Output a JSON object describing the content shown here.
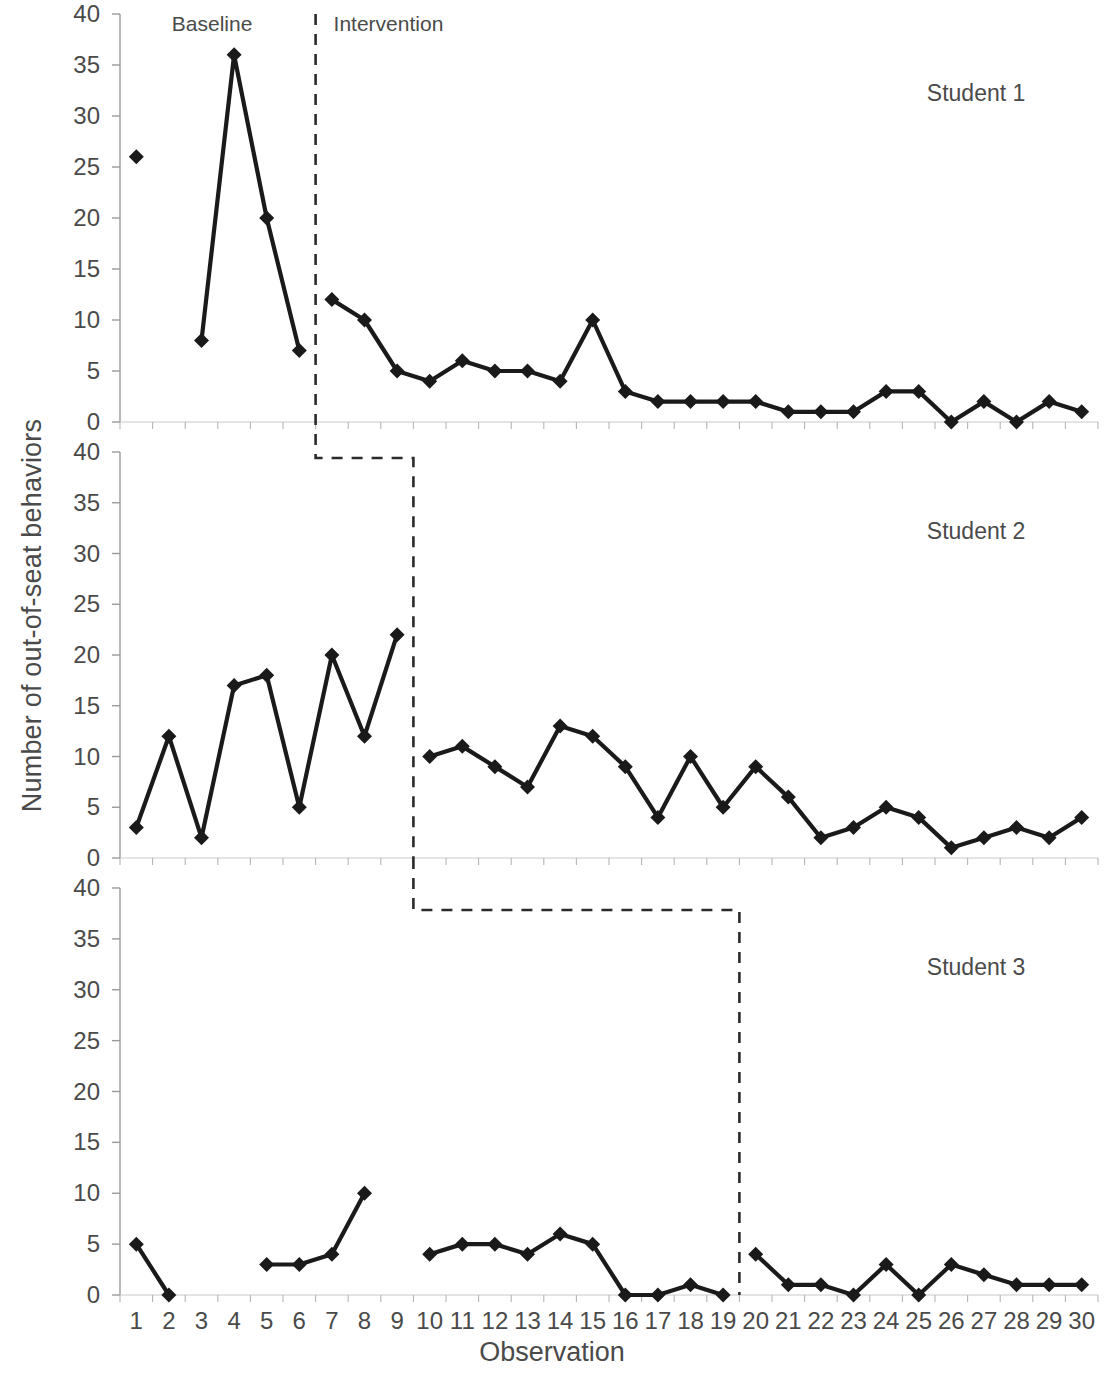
{
  "axes": {
    "ylabel": "Number of out-of-seat behaviors",
    "xlabel": "Observation",
    "yticks": [
      "0",
      "5",
      "10",
      "15",
      "20",
      "25",
      "30",
      "35",
      "40"
    ],
    "xticks": [
      "1",
      "2",
      "3",
      "4",
      "5",
      "6",
      "7",
      "8",
      "9",
      "10",
      "11",
      "12",
      "13",
      "14",
      "15",
      "16",
      "17",
      "18",
      "19",
      "20",
      "21",
      "22",
      "23",
      "24",
      "25",
      "26",
      "27",
      "28",
      "29",
      "30"
    ],
    "ylim": [
      0,
      40
    ],
    "xlim": [
      1,
      30
    ]
  },
  "annotations": {
    "baseline": "Baseline",
    "intervention": "Intervention"
  },
  "panels": [
    {
      "label": "Student 1"
    },
    {
      "label": "Student 2"
    },
    {
      "label": "Student 3"
    }
  ],
  "colors": {
    "line": "#1a1a1a",
    "marker": "#1a1a1a",
    "axis": "#9a9a9a",
    "phase_line": "#2b2b2b",
    "text": "#4a4a4a"
  },
  "chart_data": {
    "type": "line",
    "title": "",
    "subtitle": "",
    "xlabel": "Observation",
    "ylabel": "Number of out-of-seat behaviors",
    "xlim": [
      1,
      30
    ],
    "ylim": [
      0,
      40
    ],
    "yticks": [
      0,
      5,
      10,
      15,
      20,
      25,
      30,
      35,
      40
    ],
    "xticks": [
      1,
      2,
      3,
      4,
      5,
      6,
      7,
      8,
      9,
      10,
      11,
      12,
      13,
      14,
      15,
      16,
      17,
      18,
      19,
      20,
      21,
      22,
      23,
      24,
      25,
      26,
      27,
      28,
      29,
      30
    ],
    "grid": false,
    "legend": "none",
    "design": "multiple-baseline across participants",
    "phase_labels": [
      "Baseline",
      "Intervention"
    ],
    "panels": [
      {
        "name": "Student 1",
        "phase_change_after_x": 6,
        "phases": [
          {
            "name": "Baseline",
            "x": [
              1,
              3,
              4,
              5,
              6
            ],
            "y": [
              26,
              8,
              36,
              20,
              7
            ],
            "segments": [
              {
                "x": [
                  1
                ],
                "y": [
                  26
                ]
              },
              {
                "x": [
                  3,
                  4,
                  5,
                  6
                ],
                "y": [
                  8,
                  36,
                  20,
                  7
                ]
              }
            ]
          },
          {
            "name": "Intervention",
            "x": [
              7,
              8,
              9,
              10,
              11,
              12,
              13,
              14,
              15,
              16,
              17,
              18,
              19,
              20,
              21,
              22,
              23,
              24,
              25,
              26,
              27,
              28,
              29,
              30
            ],
            "y": [
              12,
              10,
              5,
              4,
              6,
              5,
              5,
              4,
              10,
              3,
              2,
              2,
              2,
              2,
              1,
              1,
              1,
              3,
              3,
              0,
              2,
              0,
              2,
              1
            ]
          }
        ]
      },
      {
        "name": "Student 2",
        "phase_change_after_x": 9,
        "phases": [
          {
            "name": "Baseline",
            "x": [
              1,
              2,
              3,
              4,
              5,
              6,
              7,
              8,
              9
            ],
            "y": [
              3,
              12,
              2,
              17,
              18,
              5,
              20,
              12,
              22
            ]
          },
          {
            "name": "Intervention",
            "x": [
              10,
              11,
              12,
              13,
              14,
              15,
              16,
              17,
              18,
              19,
              20,
              21,
              22,
              23,
              24,
              25,
              26,
              27,
              28,
              29,
              30
            ],
            "y": [
              10,
              11,
              9,
              7,
              13,
              12,
              9,
              4,
              10,
              5,
              9,
              6,
              2,
              3,
              5,
              4,
              1,
              2,
              3,
              2,
              4
            ]
          }
        ]
      },
      {
        "name": "Student 3",
        "phase_change_after_x": 19,
        "phases": [
          {
            "name": "Baseline",
            "x": [
              1,
              2,
              5,
              6,
              7,
              8,
              10,
              11,
              12,
              13,
              14,
              15,
              16,
              17,
              18,
              19
            ],
            "y": [
              5,
              0,
              3,
              3,
              4,
              10,
              4,
              5,
              5,
              4,
              6,
              5,
              0,
              0,
              1,
              0
            ],
            "segments": [
              {
                "x": [
                  1,
                  2
                ],
                "y": [
                  5,
                  0
                ]
              },
              {
                "x": [
                  5,
                  6,
                  7,
                  8
                ],
                "y": [
                  3,
                  3,
                  4,
                  10
                ]
              },
              {
                "x": [
                  10,
                  11,
                  12,
                  13,
                  14,
                  15,
                  16,
                  17,
                  18,
                  19
                ],
                "y": [
                  4,
                  5,
                  5,
                  4,
                  6,
                  5,
                  0,
                  0,
                  1,
                  0
                ]
              }
            ]
          },
          {
            "name": "Intervention",
            "x": [
              20,
              21,
              22,
              23,
              24,
              25,
              26,
              27,
              28,
              29,
              30
            ],
            "y": [
              4,
              1,
              1,
              0,
              3,
              0,
              3,
              2,
              1,
              1,
              1
            ]
          }
        ]
      }
    ]
  }
}
